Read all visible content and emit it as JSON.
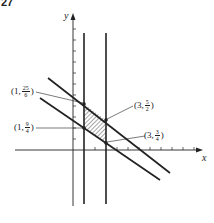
{
  "figure": {
    "number_label": "27",
    "axes": {
      "x_label": "x",
      "y_label": "y"
    },
    "points": [
      {
        "id": "p1",
        "x_text": "1",
        "num": "25",
        "den": "6"
      },
      {
        "id": "p2",
        "x_text": "1",
        "num": "9",
        "den": "4"
      },
      {
        "id": "p3",
        "x_text": "3",
        "num": "5",
        "den": "2"
      },
      {
        "id": "p4",
        "x_text": "3",
        "num": "3",
        "den": "4"
      }
    ],
    "lines": {
      "vertical": [
        "x = 1",
        "x = 3"
      ],
      "diagonal": [
        "upper boundary line",
        "lower boundary line"
      ]
    },
    "shaded_region": "hatched parallelogram bounded by x=1, x=3 and the two diagonal lines",
    "colors": {
      "ink": "#222222",
      "background": "#ffffff"
    }
  }
}
